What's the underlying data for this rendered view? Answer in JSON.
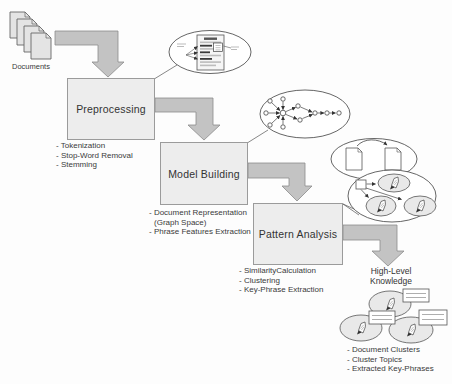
{
  "diagram": {
    "source": {
      "label": "Documents",
      "icon": "documents-stack-icon"
    },
    "stages": [
      {
        "id": "preprocessing",
        "label": "Preprocessing",
        "bullets": [
          "- Tokenization",
          "- Stop-Word Removal",
          "- Stemming"
        ],
        "artifact_icon": "annotated-document-ellipse-icon"
      },
      {
        "id": "model-building",
        "label": "Model Building",
        "bullets": [
          "- Document Representation",
          "(Graph Space)",
          "- Phrase Features Extraction"
        ],
        "artifact_icon": "graph-space-ellipse-icon"
      },
      {
        "id": "pattern-analysis",
        "label": "Pattern Analysis",
        "bullets": [
          "- SimilarityCalculation",
          "- Clustering",
          "- Key-Phrase Extraction"
        ],
        "artifact_icon": "similarity-and-clustering-ellipses-icon"
      }
    ],
    "output": {
      "label_line1": "High-Level",
      "label_line2": "Knowledge",
      "bullets": [
        "- Document Clusters",
        "- Cluster Topics",
        "- Extracted Key-Phrases"
      ],
      "icon": "knowledge-clusters-with-callouts-icon"
    },
    "colors": {
      "background": "#fdfdfd",
      "arrow_fill": "#c3c3c3",
      "arrow_border": "#8c8c8c",
      "box_fill": "#ededed",
      "box_border": "#9b9b9b",
      "ellipse_border": "#3f3f3f",
      "sub_ellipse_fill": "#e9e9e9",
      "text": "#333333"
    }
  }
}
